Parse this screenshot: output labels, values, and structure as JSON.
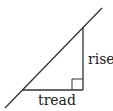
{
  "diagram": {
    "type": "stair-slope triangle",
    "labels": {
      "rise": "rise",
      "tread": "tread"
    },
    "colors": {
      "line": "#333333",
      "background": "#ffffff"
    }
  }
}
